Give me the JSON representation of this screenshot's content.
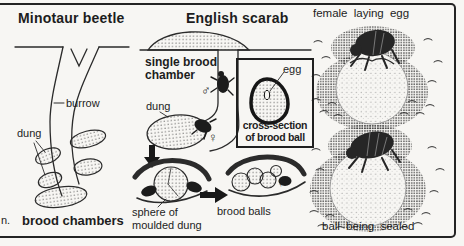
{
  "palette": {
    "paper": "#f7f6f3",
    "ink": "#1d1d1d"
  },
  "left": {
    "title": "Minotaur beetle",
    "burrow_label": "burrow",
    "dung_label": "dung",
    "caption": "brood chambers",
    "margin_fragment": "n."
  },
  "middle": {
    "title": "English scarab",
    "chamber_label": "single brood\nchamber",
    "dung_label": "dung",
    "male_symbol": "♂",
    "female_symbol_upper": "♀",
    "female_symbol_lower": "♀",
    "sphere_label": "sphere of\nmoulded dung",
    "brood_balls_label": "brood balls"
  },
  "inset": {
    "egg_label": "egg",
    "caption": "cross-section\nof brood ball"
  },
  "right": {
    "top_caption": "female laying egg",
    "bottom_caption": "ball being sealed"
  }
}
